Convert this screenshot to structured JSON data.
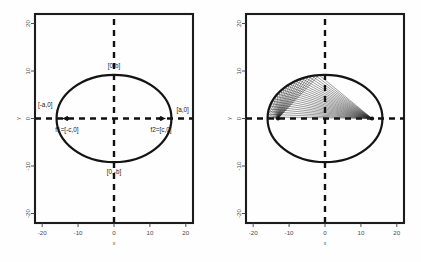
{
  "figure": {
    "background": "#ffffff",
    "panel_count": 2
  },
  "chart_data": [
    {
      "type": "scatter",
      "title": "",
      "panel": "left",
      "xlabel": "x",
      "ylabel": "y",
      "xlim": [
        -22,
        22
      ],
      "ylim": [
        -22,
        22
      ],
      "xticks": [
        -20,
        -10,
        0,
        10,
        20
      ],
      "yticks": [
        -20,
        -10,
        0,
        10,
        20
      ],
      "xtick_labels": [
        "-20",
        "-10",
        "0",
        "10",
        "20"
      ],
      "ytick_labels": [
        "-20",
        "-10",
        "0",
        "10",
        "20"
      ],
      "grid": false,
      "legend": "none",
      "ellipse": {
        "center": [
          0,
          0
        ],
        "semi_major_a": 16,
        "semi_minor_b": 9.2,
        "focal_distance_c": 13.1
      },
      "foci": [
        {
          "name": "f1",
          "x": -13.1,
          "y": 0
        },
        {
          "name": "f2",
          "x": 13.1,
          "y": 0
        }
      ],
      "dashed_axes": [
        {
          "name": "horizontal-major-axis",
          "from": [
            -22,
            0
          ],
          "to": [
            22,
            0
          ]
        },
        {
          "name": "vertical-minor-axis",
          "from": [
            0,
            -22
          ],
          "to": [
            0,
            22
          ]
        }
      ],
      "annotations": [
        {
          "id": "top-vertex",
          "text": "[0,b]",
          "x": 0,
          "y": 9.2
        },
        {
          "id": "bottom-vertex",
          "text": "[0,-b]",
          "x": 0,
          "y": -9.2
        },
        {
          "id": "left-vertex",
          "text": "[-a,0]",
          "x": -16,
          "y": 0
        },
        {
          "id": "right-vertex",
          "text": "[a,0]",
          "x": 16,
          "y": 0
        },
        {
          "id": "focus-1",
          "text": "f1=[-c,0]",
          "x": -13.1,
          "y": 0
        },
        {
          "id": "focus-2",
          "text": "f2=[c,0]",
          "x": 13.1,
          "y": 0
        }
      ]
    },
    {
      "type": "line",
      "title": "",
      "panel": "right",
      "xlabel": "x",
      "ylabel": "y",
      "xlim": [
        -22,
        22
      ],
      "ylim": [
        -22,
        22
      ],
      "xticks": [
        -20,
        -10,
        0,
        10,
        20
      ],
      "yticks": [
        -20,
        -10,
        0,
        10,
        20
      ],
      "xtick_labels": [
        "-20",
        "-10",
        "0",
        "10",
        "20"
      ],
      "ytick_labels": [
        "-20",
        "-10",
        "0",
        "10",
        "20"
      ],
      "grid": false,
      "legend": "none",
      "ellipse": {
        "center": [
          0,
          0
        ],
        "semi_major_a": 16,
        "semi_minor_b": 9.2,
        "focal_distance_c": 13.1
      },
      "foci": [
        {
          "name": "f1",
          "x": -13.1,
          "y": 0
        },
        {
          "name": "f2",
          "x": 13.1,
          "y": 0
        }
      ],
      "dashed_axes": [
        {
          "name": "horizontal-major-axis",
          "from": [
            -22,
            0
          ],
          "to": [
            22,
            0
          ]
        },
        {
          "name": "vertical-minor-axis",
          "from": [
            0,
            -22
          ],
          "to": [
            0,
            22
          ]
        }
      ],
      "reflection_rays": {
        "description": "rays from focus f1 to points on upper ellipse arc then to focus f2",
        "ray_count": 24,
        "angle_start_deg": 96,
        "angle_end_deg": 178,
        "from_focus": [
          -13.1,
          0
        ],
        "to_focus": [
          13.1,
          0
        ]
      },
      "annotations": []
    }
  ]
}
